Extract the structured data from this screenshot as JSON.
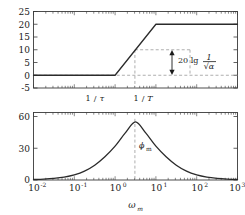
{
  "figure": {
    "name": "bode-lead-compensator",
    "xlabel": "ω",
    "xlabel_sub": "m",
    "x_tick_labels": [
      "10",
      "10",
      "10",
      "10",
      "10",
      "10"
    ],
    "x_tick_exponents": [
      "-2",
      "-1",
      "0",
      "1",
      "2",
      "3"
    ],
    "x_tick_values": [
      -2,
      -1,
      0,
      1,
      2,
      3
    ],
    "xlim": [
      -2,
      3
    ],
    "corner_labels": [
      {
        "text_num": "1",
        "text_den": "τ",
        "x": 0
      },
      {
        "text_num": "1",
        "text_den": "T",
        "x": 1
      }
    ],
    "colors": {
      "curve": "#2b2b2b",
      "frame": "#3a3a3a",
      "dashed": "#9a9a9a",
      "text": "#1a1a1a",
      "background": "#ffffff"
    }
  },
  "chart_data": [
    {
      "type": "line",
      "name": "magnitude-plot",
      "title": "",
      "xlabel": "",
      "ylabel": "",
      "xscale": "log",
      "xlim": [
        -2,
        3
      ],
      "ylim": [
        -5,
        25
      ],
      "ytick_labels": [
        "25",
        "20",
        "15",
        "10",
        "5",
        "0",
        "-5"
      ],
      "ytick_values": [
        25,
        20,
        15,
        10,
        5,
        0,
        -5
      ],
      "grid": false,
      "legend": null,
      "series": [
        {
          "name": "asymptotic-magnitude-dB",
          "x": [
            -2,
            0,
            1,
            3
          ],
          "y": [
            0,
            0,
            20,
            20
          ]
        }
      ],
      "annotations": [
        {
          "name": "zero-db-dashed-line",
          "type": "hline",
          "y": 0
        },
        {
          "name": "omega-m-dashed-line",
          "type": "vline",
          "x": 0.5,
          "y_from": 0,
          "y_to": 10
        },
        {
          "name": "box-top-dashed",
          "type": "hline-seg",
          "y": 10,
          "x_from": 0.5,
          "x_to": 1.85
        },
        {
          "name": "box-right-dashed",
          "type": "vline",
          "x": 1.85,
          "y_from": 0,
          "y_to": 10
        },
        {
          "name": "magnitude-gain-arrow",
          "type": "double-arrow",
          "x": 1.6,
          "y_from": 0,
          "y_to": 10
        },
        {
          "name": "gain-annotation",
          "type": "text",
          "text_prefix": "20 lg",
          "text_num": "1",
          "text_den": "√α",
          "x": 1.9,
          "y": 6
        }
      ]
    },
    {
      "type": "line",
      "name": "phase-plot",
      "title": "",
      "xlabel": "",
      "ylabel": "",
      "xscale": "log",
      "xlim": [
        -2,
        3
      ],
      "ylim": [
        0,
        62
      ],
      "ytick_labels": [
        "60",
        "30",
        "0"
      ],
      "ytick_values": [
        60,
        30,
        0
      ],
      "grid": false,
      "legend": null,
      "series": [
        {
          "name": "phase-deg",
          "x": [
            -2.0,
            -1.75,
            -1.5,
            -1.25,
            -1.0,
            -0.75,
            -0.5,
            -0.25,
            0.0,
            0.25,
            0.5,
            0.75,
            1.0,
            1.25,
            1.5,
            1.75,
            2.0,
            2.25,
            2.5,
            2.75,
            3.0
          ],
          "y": [
            0.5,
            0.9,
            1.6,
            2.8,
            4.9,
            8.4,
            14.0,
            22.0,
            32.0,
            44.5,
            54.9,
            44.5,
            32.0,
            22.0,
            14.0,
            8.4,
            4.9,
            2.8,
            1.6,
            0.9,
            0.5
          ]
        }
      ],
      "annotations": [
        {
          "name": "phi-m-dashed-line",
          "type": "vline",
          "x": 0.5,
          "y_from": 0,
          "y_to": 55
        },
        {
          "name": "phi-m-label",
          "type": "text",
          "text": "ϕ",
          "text_sub": "m",
          "x": 0.62,
          "y": 34
        }
      ]
    }
  ]
}
